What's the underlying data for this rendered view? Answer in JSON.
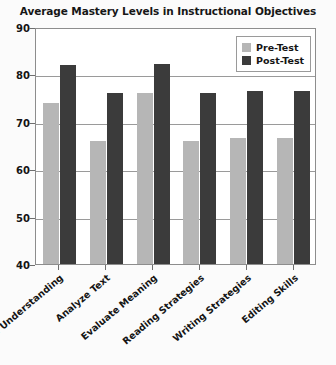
{
  "chart_data": {
    "type": "bar",
    "title": "Average Mastery Levels in Instructional Objectives",
    "xlabel": "",
    "ylabel": "",
    "ylim": [
      40,
      90
    ],
    "yticks": [
      40,
      50,
      60,
      70,
      80,
      90
    ],
    "grid": true,
    "legend_position": "top-right",
    "categories": [
      "Basic Understanding",
      "Analyze Text",
      "Evaluate Meaning",
      "Reading Strategies",
      "Writing Strategies",
      "Editing Skills"
    ],
    "series": [
      {
        "name": "Pre-Test",
        "color": "#b6b6b6",
        "values": [
          74,
          66,
          76,
          66,
          66.5,
          66.5
        ]
      },
      {
        "name": "Post-Test",
        "color": "#3b3b3b",
        "values": [
          82,
          76,
          82.2,
          76,
          76.5,
          76.5
        ]
      }
    ]
  },
  "legend": {
    "items": [
      {
        "label": "Pre-Test",
        "key": "pre"
      },
      {
        "label": "Post-Test",
        "key": "post"
      }
    ]
  }
}
